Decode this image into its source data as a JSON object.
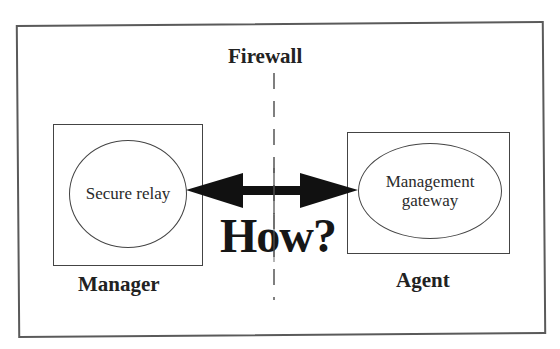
{
  "diagram": {
    "title": "Firewall",
    "question": "How?",
    "manager": {
      "label": "Manager",
      "component": "Secure relay"
    },
    "agent": {
      "label": "Agent",
      "component_line1": "Management",
      "component_line2": "gateway"
    },
    "connection": {
      "type": "bidirectional-arrow",
      "from": "Secure relay",
      "to": "Management gateway"
    },
    "boundary": {
      "type": "dashed-line",
      "name": "Firewall"
    },
    "colors": {
      "line": "#444444",
      "arrow": "#111111",
      "text": "#222222",
      "background": "#ffffff"
    }
  }
}
